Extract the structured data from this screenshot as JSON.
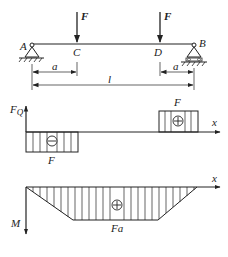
{
  "beam": {
    "points": {
      "A": "A",
      "B": "B",
      "C": "C",
      "D": "D"
    },
    "loads": [
      "F",
      "F"
    ],
    "dims": {
      "a_left": "a",
      "a_right": "a",
      "length": "l"
    }
  },
  "shear_diagram": {
    "axis_label": "F",
    "axis_sub": "Q",
    "x_label": "x",
    "neg_value": "F",
    "pos_value": "F",
    "neg_sign": "−",
    "pos_sign": "+"
  },
  "moment_diagram": {
    "axis_label": "M",
    "x_label": "x",
    "value": "Fa",
    "sign": "+"
  }
}
